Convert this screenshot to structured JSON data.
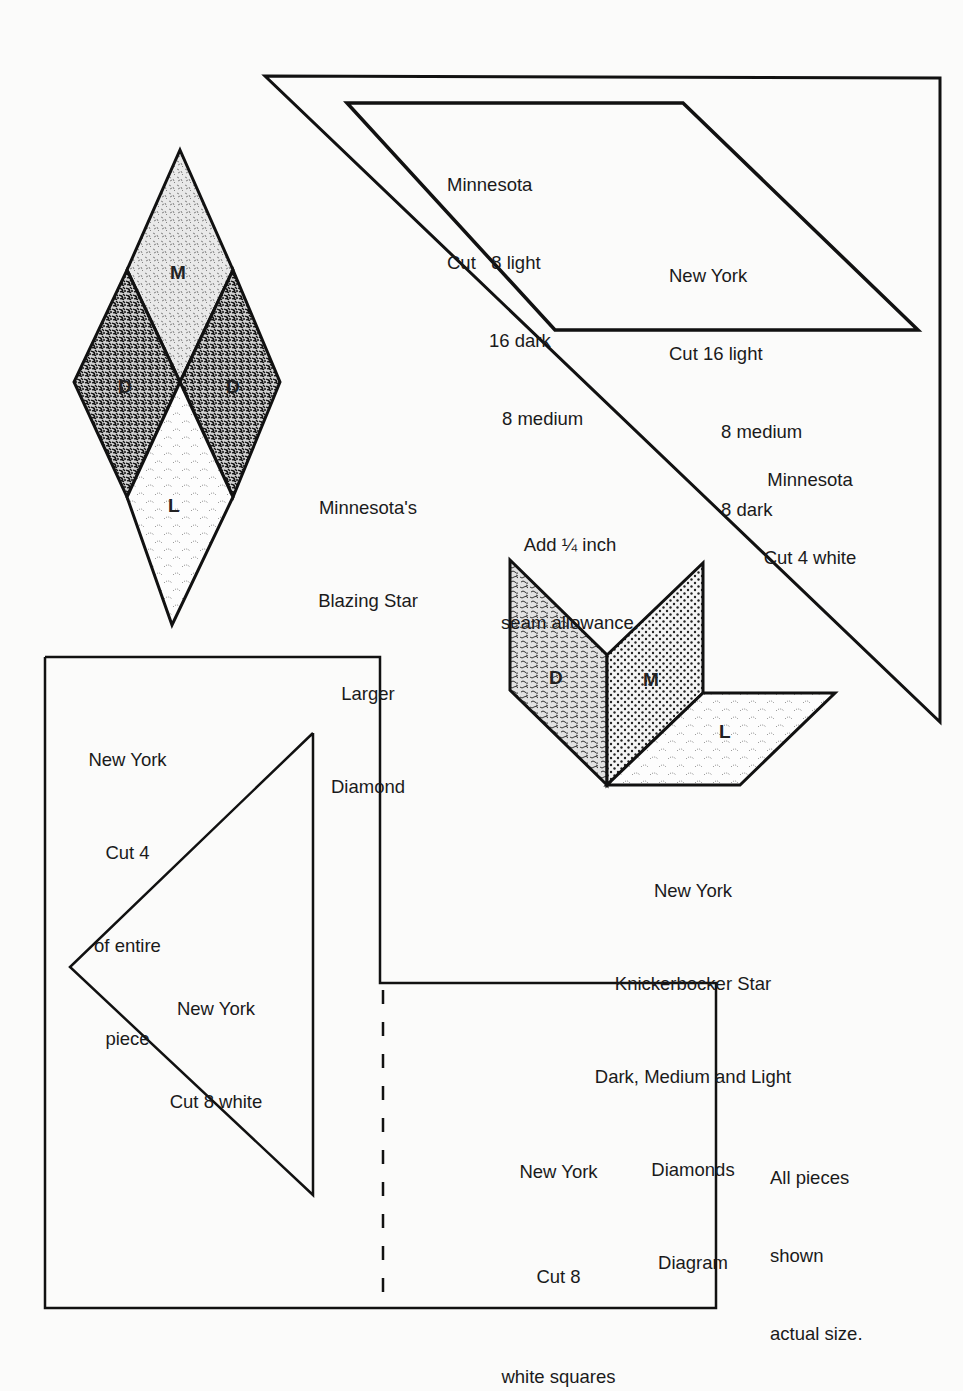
{
  "page": {
    "type": "quilt pattern sheet",
    "line_color": "#111111",
    "background": "#fbfbfa"
  },
  "large_triangle": {
    "label_lines": [
      "Minnesota",
      "Cut 4 white"
    ]
  },
  "parallelogram": {
    "minnesota_lines": [
      "Minnesota",
      "Cut   8 light",
      "16 dark",
      "8 medium"
    ],
    "newyork_lines": [
      "New York",
      "Cut 16 light",
      "8 medium",
      "8 dark"
    ]
  },
  "blazing_star": {
    "pieces": [
      {
        "letter": "M",
        "fabric": "medium"
      },
      {
        "letter": "D",
        "fabric": "dark"
      },
      {
        "letter": "D",
        "fabric": "dark"
      },
      {
        "letter": "L",
        "fabric": "light"
      }
    ],
    "caption_lines": [
      "Minnesota's",
      "Blazing Star",
      "Larger",
      "Diamond"
    ]
  },
  "seam_note": {
    "lines": [
      "Add ¼ inch",
      "seam allowance."
    ]
  },
  "knickerbocker": {
    "pieces": [
      {
        "letter": "D",
        "fabric": "dark"
      },
      {
        "letter": "M",
        "fabric": "medium"
      },
      {
        "letter": "L",
        "fabric": "light"
      }
    ],
    "caption_lines": [
      "New York",
      "Knickerbocker Star",
      "Dark, Medium and Light",
      "Diamonds",
      "Diagram"
    ]
  },
  "ny_corner_piece": {
    "label_lines": [
      "New York",
      "Cut 4",
      "of entire",
      "piece"
    ]
  },
  "ny_triangle": {
    "label_lines": [
      "New York",
      "Cut 8 white"
    ]
  },
  "ny_square": {
    "label_lines": [
      "New York",
      "Cut 8",
      "white squares"
    ]
  },
  "size_note": {
    "lines": [
      "All pieces",
      "shown",
      "actual size."
    ]
  }
}
